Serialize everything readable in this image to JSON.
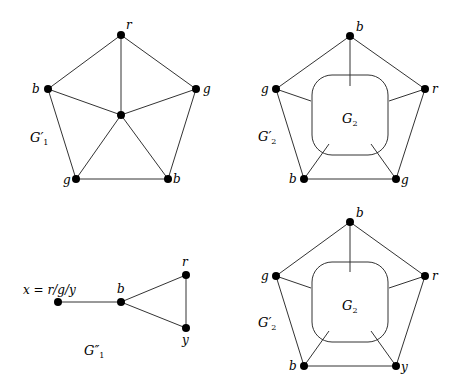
{
  "graphs": [
    {
      "name": "G1-prime",
      "label": "G′",
      "label_sub": "1",
      "vertices": [
        {
          "id": "top",
          "label": "r",
          "x": 121,
          "y": 35
        },
        {
          "id": "left",
          "label": "b",
          "x": 48,
          "y": 89
        },
        {
          "id": "right",
          "label": "g",
          "x": 196,
          "y": 89
        },
        {
          "id": "center",
          "label": "",
          "x": 121,
          "y": 115
        },
        {
          "id": "bottom-left",
          "label": "g",
          "x": 76,
          "y": 179
        },
        {
          "id": "bottom-right",
          "label": "b",
          "x": 168,
          "y": 179
        }
      ]
    },
    {
      "name": "G2-prime-top",
      "label": "G′",
      "label_sub": "2",
      "inner_label": "G",
      "inner_sub": "2",
      "vertices": [
        {
          "id": "top",
          "label": "b",
          "x": 350,
          "y": 36
        },
        {
          "id": "left",
          "label": "g",
          "x": 276,
          "y": 89
        },
        {
          "id": "right",
          "label": "r",
          "x": 425,
          "y": 89
        },
        {
          "id": "bottom-left",
          "label": "b",
          "x": 304,
          "y": 179
        },
        {
          "id": "bottom-right",
          "label": "g",
          "x": 396,
          "y": 179
        }
      ]
    },
    {
      "name": "G1-double-prime",
      "label": "G″",
      "label_sub": "1",
      "vertices": [
        {
          "id": "x",
          "label": "x = r/g/y",
          "x": 58,
          "y": 302
        },
        {
          "id": "b",
          "label": "b",
          "x": 121,
          "y": 302
        },
        {
          "id": "r",
          "label": "r",
          "x": 186,
          "y": 275
        },
        {
          "id": "y",
          "label": "y",
          "x": 186,
          "y": 328
        }
      ]
    },
    {
      "name": "G2-prime-bottom",
      "label": "G′",
      "label_sub": "2",
      "inner_label": "G",
      "inner_sub": "2",
      "vertices": [
        {
          "id": "top",
          "label": "b",
          "x": 350,
          "y": 222
        },
        {
          "id": "left",
          "label": "g",
          "x": 276,
          "y": 276
        },
        {
          "id": "right",
          "label": "r",
          "x": 425,
          "y": 276
        },
        {
          "id": "bottom-left",
          "label": "b",
          "x": 304,
          "y": 366
        },
        {
          "id": "bottom-right",
          "label": "y",
          "x": 396,
          "y": 366
        }
      ]
    }
  ]
}
